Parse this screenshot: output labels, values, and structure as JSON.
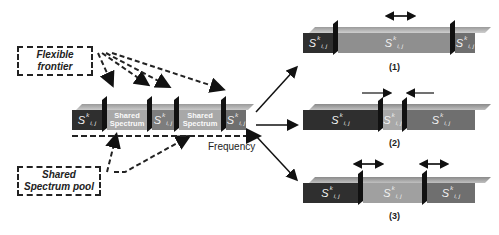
{
  "labels": {
    "flexible_frontier": [
      "Flexible",
      "frontier"
    ],
    "shared_pool": [
      "Shared",
      "Spectrum pool"
    ],
    "frequency": "Frequency",
    "shared_spectrum": [
      "Shared",
      "Spectrum"
    ],
    "symbol": "S",
    "sup": "k",
    "sub": "i, j",
    "case1": "(1)",
    "case2": "(2)",
    "case3": "(3)"
  },
  "colors": {
    "dark": "#2e2e2e",
    "mid": "#8c8c8c",
    "light": "#b9b9b9",
    "midgray": "#6f6f6f",
    "frontier": "#111111"
  }
}
